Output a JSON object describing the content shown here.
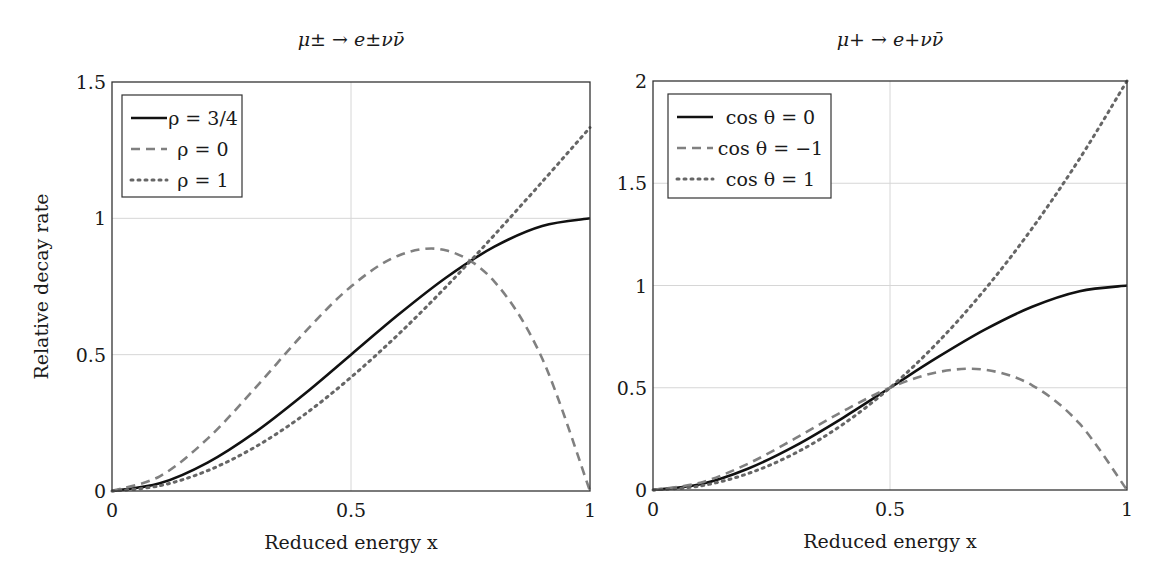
{
  "chart_data": [
    {
      "type": "line",
      "title": "μ± → e±νν̄",
      "xlabel": "Reduced energy x",
      "ylabel": "Relative decay rate",
      "xlim": [
        0,
        1
      ],
      "ylim": [
        0,
        1.5
      ],
      "xticks": [
        0,
        0.5,
        1
      ],
      "xtick_labels": [
        "0",
        "0.5",
        "1"
      ],
      "yticks": [
        0,
        0.5,
        1,
        1.5
      ],
      "ytick_labels": [
        "0",
        "0.5",
        "1",
        "1.5"
      ],
      "grid": true,
      "legend_position": "upper left",
      "x": [
        0,
        0.1,
        0.2,
        0.3,
        0.4,
        0.5,
        0.6,
        0.7,
        0.8,
        0.9,
        1.0
      ],
      "series": [
        {
          "name": "ρ = 3/4",
          "style": "solid",
          "color": "#111111",
          "values": [
            0,
            0.028,
            0.104,
            0.216,
            0.352,
            0.5,
            0.648,
            0.784,
            0.896,
            0.972,
            1.0
          ]
        },
        {
          "name": "ρ = 0",
          "style": "dashed",
          "color": "#808080",
          "values": [
            0,
            0.054,
            0.192,
            0.378,
            0.576,
            0.75,
            0.864,
            0.882,
            0.768,
            0.486,
            0.0
          ]
        },
        {
          "name": "ρ = 1",
          "style": "dotted",
          "color": "#666666",
          "values": [
            0,
            0.0193,
            0.0747,
            0.162,
            0.277,
            0.417,
            0.576,
            0.751,
            0.939,
            1.134,
            1.333
          ]
        }
      ]
    },
    {
      "type": "line",
      "title": "μ+ → e+νν̄",
      "xlabel": "Reduced energy x",
      "ylabel": "",
      "xlim": [
        0,
        1
      ],
      "ylim": [
        0,
        2
      ],
      "xticks": [
        0,
        0.5,
        1
      ],
      "xtick_labels": [
        "0",
        "0.5",
        "1"
      ],
      "yticks": [
        0,
        0.5,
        1,
        1.5,
        2
      ],
      "ytick_labels": [
        "0",
        "0.5",
        "1",
        "1.5",
        "2"
      ],
      "grid": true,
      "legend_position": "upper left",
      "x": [
        0,
        0.1,
        0.2,
        0.3,
        0.4,
        0.5,
        0.6,
        0.7,
        0.8,
        0.9,
        1.0
      ],
      "series": [
        {
          "name": "cos θ = 0",
          "style": "solid",
          "color": "#111111",
          "values": [
            0,
            0.028,
            0.104,
            0.216,
            0.352,
            0.5,
            0.648,
            0.784,
            0.896,
            0.972,
            1.0
          ]
        },
        {
          "name": "cos θ = −1",
          "style": "dashed",
          "color": "#808080",
          "values": [
            0,
            0.036,
            0.128,
            0.252,
            0.384,
            0.5,
            0.576,
            0.588,
            0.512,
            0.324,
            0.0
          ]
        },
        {
          "name": "cos θ = 1",
          "style": "dotted",
          "color": "#666666",
          "values": [
            0,
            0.02,
            0.08,
            0.18,
            0.32,
            0.5,
            0.72,
            0.98,
            1.28,
            1.62,
            2.0
          ]
        }
      ]
    }
  ],
  "panels": [
    {
      "title": "μ± → e±νν̄",
      "xlabel": "Reduced energy x",
      "ylabel": "Relative decay rate",
      "legend": [
        "ρ = 3/4",
        "ρ = 0",
        "ρ = 1"
      ]
    },
    {
      "title": "μ+ → e+νν̄",
      "xlabel": "Reduced energy x",
      "ylabel": "",
      "legend": [
        "cos θ = 0",
        "cos θ = −1",
        "cos θ = 1"
      ]
    }
  ]
}
